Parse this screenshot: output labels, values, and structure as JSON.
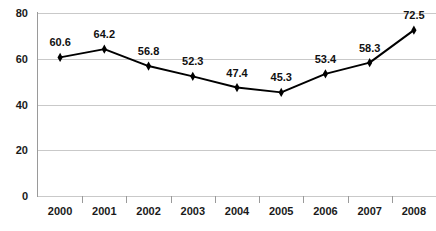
{
  "chart_data": {
    "type": "line",
    "title": "",
    "subtitle": "",
    "xlabel": "",
    "ylabel": "",
    "categories": [
      "2000",
      "2001",
      "2002",
      "2003",
      "2004",
      "2005",
      "2006",
      "2007",
      "2008"
    ],
    "values": [
      60.6,
      64.2,
      56.8,
      52.3,
      47.4,
      45.3,
      53.4,
      58.3,
      72.5
    ],
    "data_labels": [
      "60.6",
      "64.2",
      "56.8",
      "52.3",
      "47.4",
      "45.3",
      "53.4",
      "58.3",
      "72.5"
    ],
    "ylim": [
      0,
      80
    ],
    "ytick_values": [
      0,
      20,
      40,
      60,
      80
    ],
    "ytick_labels": [
      "0",
      "20",
      "40",
      "60",
      "80"
    ],
    "grid": true,
    "legend": false,
    "legend_position": "none",
    "annotations": []
  },
  "style": {
    "line_color": "#000000",
    "marker_color": "#000000",
    "grid_color": "#c9c9c9",
    "axis_color": "#9a9a9a",
    "label_color": "#111111",
    "background": "#ffffff"
  }
}
